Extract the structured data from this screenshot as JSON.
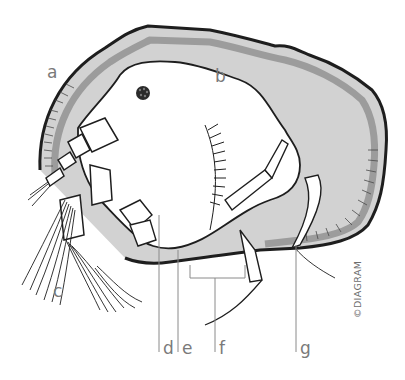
{
  "diagram": {
    "colors": {
      "outline": "#1e1e1e",
      "shell_fill": "#d2d2d2",
      "shell_band": "#9c9c9c",
      "body_fill": "#ffffff",
      "leader_line": "#8a8a8a",
      "label_text": "#7a7a7a"
    },
    "labels": [
      {
        "id": "a",
        "text": "a"
      },
      {
        "id": "b",
        "text": "b"
      },
      {
        "id": "c",
        "text": "c"
      },
      {
        "id": "d",
        "text": "d"
      },
      {
        "id": "e",
        "text": "e"
      },
      {
        "id": "f",
        "text": "f"
      },
      {
        "id": "g",
        "text": "g"
      }
    ],
    "copyright": "©DIAGRAM"
  }
}
